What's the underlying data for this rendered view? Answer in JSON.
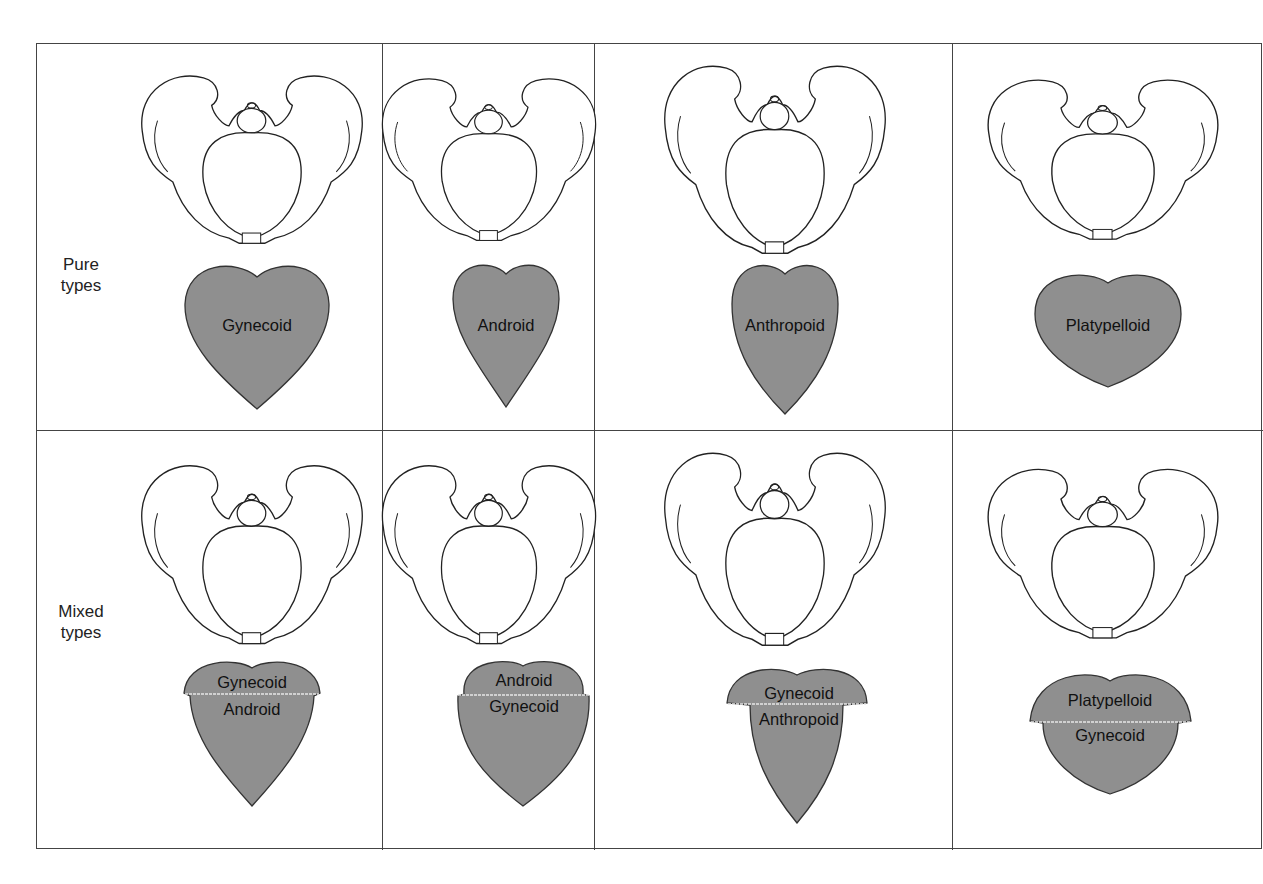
{
  "figure": {
    "rows": [
      {
        "label_line1": "Pure",
        "label_line2": "types"
      },
      {
        "label_line1": "Mixed",
        "label_line2": "types"
      }
    ],
    "pure_types": [
      {
        "name": "Gynecoid"
      },
      {
        "name": "Android"
      },
      {
        "name": "Anthropoid"
      },
      {
        "name": "Platypelloid"
      }
    ],
    "mixed_types": [
      {
        "top": "Gynecoid",
        "bottom": "Android"
      },
      {
        "top": "Android",
        "bottom": "Gynecoid"
      },
      {
        "top": "Gynecoid",
        "bottom": "Anthropoid"
      },
      {
        "top": "Platypelloid",
        "bottom": "Gynecoid"
      }
    ],
    "colors": {
      "shape_fill": "#8f8f8f",
      "line": "#333333",
      "divider": "#e6e6e6"
    }
  }
}
